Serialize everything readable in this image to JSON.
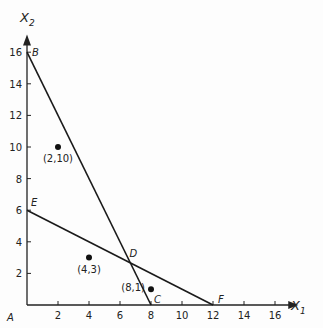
{
  "chart_data": {
    "type": "line",
    "title": "",
    "xlabel": "X1",
    "ylabel": "X2",
    "xlim": [
      0,
      17.5
    ],
    "ylim": [
      0,
      17
    ],
    "x_ticks": [
      2,
      4,
      6,
      8,
      10,
      12,
      14,
      16
    ],
    "y_ticks": [
      2,
      4,
      6,
      8,
      10,
      12,
      14,
      16
    ],
    "grid": false,
    "series": [
      {
        "name": "line-BC",
        "points": [
          [
            0,
            16
          ],
          [
            8,
            0
          ]
        ]
      },
      {
        "name": "line-EF",
        "points": [
          [
            0,
            6
          ],
          [
            12,
            0
          ]
        ]
      }
    ],
    "vertices": [
      {
        "label": "A",
        "x": 0,
        "y": 0
      },
      {
        "label": "B",
        "x": 0,
        "y": 16
      },
      {
        "label": "C",
        "x": 8,
        "y": 0
      },
      {
        "label": "D",
        "x": 6.67,
        "y": 2.67
      },
      {
        "label": "E",
        "x": 0,
        "y": 6
      },
      {
        "label": "F",
        "x": 12,
        "y": 0
      }
    ],
    "points": [
      {
        "label": "(2,10)",
        "x": 2,
        "y": 10
      },
      {
        "label": "(4,3)",
        "x": 4,
        "y": 3
      },
      {
        "label": "(8,1)",
        "x": 8,
        "y": 1
      }
    ]
  },
  "axis": {
    "x_name": "X",
    "x_sub": "1",
    "y_name": "X",
    "y_sub": "2"
  }
}
